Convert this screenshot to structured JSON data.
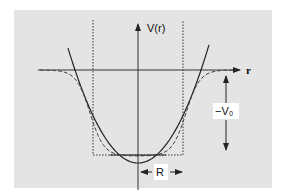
{
  "diagram": {
    "y_axis_label": "V(r)",
    "x_axis_label": "r",
    "depth_label": "−V₀",
    "radius_label": "R",
    "curves": [
      {
        "name": "square-well",
        "style": "dotted"
      },
      {
        "name": "harmonic-oscillator",
        "style": "solid"
      },
      {
        "name": "woods-saxon",
        "style": "dashed"
      }
    ],
    "colors": {
      "panel_background": "#e4e4e4",
      "line": "#222222",
      "label_box": "#ffffff"
    }
  }
}
